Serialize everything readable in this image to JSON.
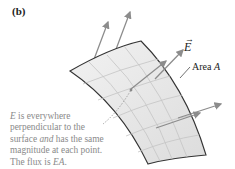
{
  "figure": {
    "panel_label": "(b)",
    "vector_label": "E",
    "vector_accent": "→",
    "area_label_prefix": "Area ",
    "area_label_var": "A",
    "caption": {
      "line1_var": "E",
      "line1_rest": " is everywhere",
      "line2": "perpendicular to the",
      "line3_pre": "surface ",
      "line3_em": "and",
      "line3_post": " has the same",
      "line4": "magnitude at each point.",
      "line5_pre": "The flux is ",
      "line5_em": "EA",
      "line5_post": "."
    },
    "colors": {
      "surface_fill": "#e6e6e6",
      "surface_edge": "#333333",
      "grid": "#c8c8c8",
      "arrow": "#8c8c8c",
      "caption_text": "#8a8a8a",
      "label_text": "#222222"
    }
  }
}
